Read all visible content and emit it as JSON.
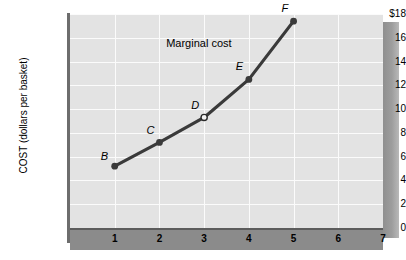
{
  "chart_data": {
    "type": "line",
    "title": "",
    "xlabel": "",
    "ylabel": "COST (dollars per basket)",
    "xlim": [
      0,
      7
    ],
    "ylim": [
      0,
      18
    ],
    "grid": true,
    "legend": "none",
    "y_axis_top_label": "$18",
    "yticks": [
      {
        "value": 18,
        "label": "$18"
      },
      {
        "value": 16,
        "label": "16"
      },
      {
        "value": 14,
        "label": "14"
      },
      {
        "value": 12,
        "label": "12"
      },
      {
        "value": 10,
        "label": "10"
      },
      {
        "value": 8,
        "label": "8"
      },
      {
        "value": 6,
        "label": "6"
      },
      {
        "value": 4,
        "label": "4"
      },
      {
        "value": 2,
        "label": "2"
      },
      {
        "value": 0,
        "label": "0"
      }
    ],
    "xticks": [
      {
        "value": 1,
        "label": "1"
      },
      {
        "value": 2,
        "label": "2"
      },
      {
        "value": 3,
        "label": "3"
      },
      {
        "value": 4,
        "label": "4"
      },
      {
        "value": 5,
        "label": "5"
      },
      {
        "value": 6,
        "label": "6"
      },
      {
        "value": 7,
        "label": "7"
      }
    ],
    "series": [
      {
        "name": "Marginal cost",
        "x": [
          1,
          2,
          3,
          4,
          5
        ],
        "values": [
          5.2,
          7.2,
          9.3,
          12.5,
          17.4
        ],
        "point_labels": [
          "B",
          "C",
          "D",
          "E",
          "F"
        ],
        "point_styles": [
          "filled",
          "filled",
          "open",
          "filled",
          "filled"
        ],
        "color": "#3a3a3a"
      }
    ],
    "annotations": [
      {
        "text": "Marginal cost",
        "x": 3.0,
        "y": 15.6
      }
    ],
    "colors": {
      "panel": "#e3e3e3",
      "gridline": "#fbfbfb",
      "axis": "#6d6d6d",
      "axis_band": "#8b8b8b",
      "curve": "#3a3a3a",
      "shadow": "#9d9d9d"
    }
  }
}
